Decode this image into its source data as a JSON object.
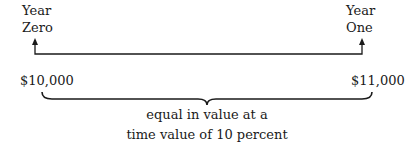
{
  "timeline": {
    "start": {
      "line1": "Year",
      "line2": "Zero"
    },
    "end": {
      "line1": "Year",
      "line2": "One"
    }
  },
  "amounts": {
    "present_value": "$10,000",
    "future_value": "$11,000"
  },
  "caption": {
    "line1": "equal in value at a",
    "line2": "time value of 10 percent"
  },
  "colors": {
    "ink": "#1a1a1a",
    "background": "#ffffff"
  }
}
